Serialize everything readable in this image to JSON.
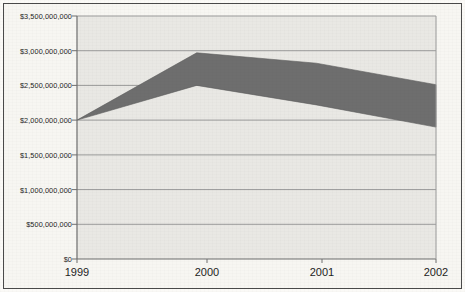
{
  "chart_data": {
    "type": "area",
    "title": "",
    "subtitle": "",
    "xlabel": "",
    "ylabel": "",
    "categories": [
      "1999",
      "2000",
      "2001",
      "2002"
    ],
    "x": [
      1999,
      2000,
      2001,
      2002
    ],
    "series": [
      {
        "name": "upper",
        "values": [
          2000000000,
          2970000000,
          2820000000,
          2510000000
        ]
      },
      {
        "name": "lower",
        "values": [
          2000000000,
          2500000000,
          2220000000,
          1900000000
        ]
      }
    ],
    "band_fill_color": "#6e6e6e",
    "plot_background_color": "#e9e8e4",
    "gridline_color": "#9a9a9a",
    "axis_color": "#6f6f6f",
    "frame_color": "#4a4a4a",
    "text_color": "#1d1d1d",
    "ylim": [
      0,
      3500000000
    ],
    "ytick_step": 500000000,
    "grid": true,
    "grid_axis": "y",
    "legend": false,
    "legend_position": "none",
    "ytick_labels": [
      "$3,500,000,000",
      "$3,000,000,000",
      "$2,500,000,000",
      "$2,000,000,000",
      "$1,500,000,000",
      "$1,000,000,000",
      "$500,000,000",
      "$0"
    ],
    "ytick_values": [
      3500000000,
      3000000000,
      2500000000,
      2000000000,
      1500000000,
      1000000000,
      500000000,
      0
    ],
    "xtick_labels": [
      "1999",
      "2000",
      "2001",
      "2002"
    ],
    "annotations": []
  }
}
